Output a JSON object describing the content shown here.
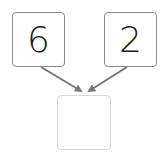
{
  "diagram": {
    "type": "number-bond",
    "parts": [
      {
        "label": "6"
      },
      {
        "label": "2"
      }
    ],
    "whole": {
      "label": ""
    },
    "colors": {
      "box_border": "#8a8a8a",
      "answer_border": "#d8d8d8",
      "arrow": "#777777",
      "text": "#1a1a1a"
    }
  }
}
